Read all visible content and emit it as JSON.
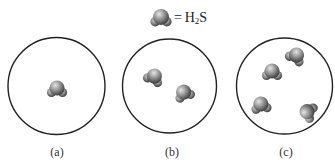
{
  "legend": {
    "equals": "=",
    "formula_main": "H",
    "formula_sub": "2",
    "formula_tail": "S",
    "icon": "h2s-molecule-icon"
  },
  "panels": [
    {
      "label": "(a)",
      "molecule_count": 1
    },
    {
      "label": "(b)",
      "molecule_count": 2
    },
    {
      "label": "(c)",
      "molecule_count": 4
    }
  ],
  "colors": {
    "circle_stroke": "#222222",
    "molecule_light": "#d8d8d8",
    "molecule_mid": "#8a8a8a",
    "molecule_dark": "#3a3a3a"
  }
}
